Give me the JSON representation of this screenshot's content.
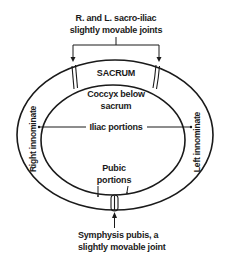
{
  "diagram": {
    "labels": {
      "sacroiliac_line1": "R. and L. sacro-iliac",
      "sacroiliac_line2": "slightly movable joints",
      "sacrum": "SACRUM",
      "coccyx_line1": "Coccyx below",
      "coccyx_line2": "sacrum",
      "iliac": "Iliac portions",
      "right_innominate": "Right innominate",
      "left_innominate": "Left innominate",
      "pubic_line1": "Pubic",
      "pubic_line2": "portions",
      "symphysis_line1": "Symphysis pubis, a",
      "symphysis_line2": "slightly movable joint"
    },
    "colors": {
      "line": "#1a1a1a",
      "background": "#ffffff"
    }
  }
}
